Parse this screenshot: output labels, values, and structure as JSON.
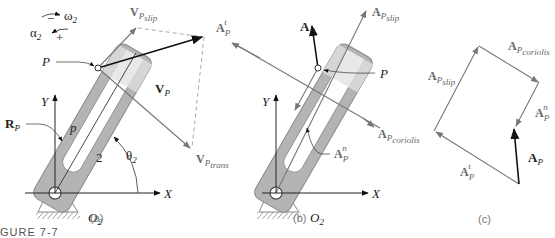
{
  "figure": {
    "caption": "GURE 7-7",
    "panels": [
      {
        "id": "a",
        "label": "(a)"
      },
      {
        "id": "b",
        "label": "(b)"
      },
      {
        "id": "c",
        "label": "(c)"
      }
    ]
  },
  "panel_a": {
    "omega": {
      "sym": "ω",
      "sub": "2"
    },
    "alpha": {
      "sym": "α",
      "sub": "2"
    },
    "minus": "−",
    "plus": "+",
    "point_P": "P",
    "axis_y": "Y",
    "axis_x": "X",
    "origin": {
      "sym": "O",
      "sub": "2"
    },
    "link_number": "2",
    "theta": {
      "sym": "θ",
      "sub": "2"
    },
    "Rp": {
      "sym": "R",
      "sub": "P"
    },
    "p_len": "p",
    "Vp": {
      "sym": "V",
      "sub": "P"
    },
    "Vslip": {
      "sym": "V",
      "sub": "P",
      "subsub": "slip"
    },
    "Vtrans": {
      "sym": "V",
      "sub": "P",
      "subsub": "trans"
    }
  },
  "panel_b": {
    "point_P": "P",
    "axis_y": "Y",
    "axis_x": "X",
    "origin": {
      "sym": "O",
      "sub": "2"
    },
    "Ap": {
      "sym": "A",
      "sub": "P"
    },
    "At": {
      "sym": "A",
      "sub": "P",
      "sup": "t"
    },
    "An": {
      "sym": "A",
      "sub": "P",
      "sup": "n"
    },
    "Aslip": {
      "sym": "A",
      "sub": "P",
      "subsub": "slip"
    },
    "Acoriolis": {
      "sym": "A",
      "sub": "P",
      "subsub": "coriolis"
    }
  },
  "panel_c": {
    "Ap": {
      "sym": "A",
      "sub": "P"
    },
    "At": {
      "sym": "A",
      "sub": "P",
      "sup": "t"
    },
    "An": {
      "sym": "A",
      "sub": "P",
      "sup": "n"
    },
    "Aslip": {
      "sym": "A",
      "sub": "P",
      "subsub": "slip"
    },
    "Acoriolis": {
      "sym": "A",
      "sub": "P",
      "subsub": "coriolis"
    }
  },
  "colors": {
    "link_fill": "#b4b4b4",
    "link_stroke": "#8a8a8a",
    "slider_fill": "#e6e6e6",
    "vector_black": "#111111",
    "vector_gray": "#7a7a7a",
    "dashed": "#a0a0a0"
  }
}
